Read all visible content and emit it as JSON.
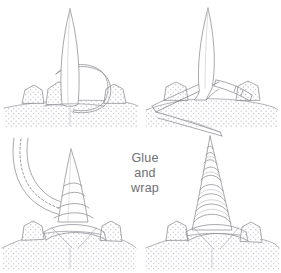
{
  "figure": {
    "title": "Glue and wrap",
    "background_color": "#ffffff",
    "line_color": "#8c8c92",
    "dark_line_color": "#6f6f77",
    "stipple_color": "#b9b9c0",
    "text_color": "#6e6e73",
    "width": 281,
    "height": 273
  },
  "annotation": {
    "line1": "Glue",
    "line2": "and",
    "line3": "wrap"
  },
  "panels": [
    {
      "id": "panel-1",
      "position": "top-left",
      "name": "horn-with-strip-loop",
      "description": "Slender horn standing on stippled ground between two rocks, with a loop of strip material encircling its base",
      "elements": [
        "horn-blade",
        "strip-loop",
        "rock-left",
        "rock-right",
        "ground-stipple",
        "center-seam"
      ]
    },
    {
      "id": "panel-2",
      "position": "top-right",
      "name": "horn-with-diagonal-strip",
      "description": "Horn with a long diagonal strip passing across and behind its base, trailing down to the lower right",
      "elements": [
        "horn-blade",
        "diagonal-strip",
        "strip-tail",
        "rock-left",
        "rock-right",
        "ground-stipple"
      ]
    },
    {
      "id": "panel-3",
      "position": "bottom-left",
      "name": "horn-begin-wrapping",
      "description": "Curved strip with dashed glue line sweeping in from upper left, first wraps applied around the cone base",
      "elements": [
        "curved-strip",
        "glue-dashed-line",
        "cone",
        "wrap-band-1",
        "wrap-band-2",
        "wrap-band-3",
        "rock-left",
        "rock-right",
        "ground-stipple"
      ]
    },
    {
      "id": "panel-4",
      "position": "bottom-right",
      "name": "horn-fully-wrapped",
      "description": "Finished tall spiral-wrapped horn, bands running from base to tip",
      "elements": [
        "cone",
        "spiral-wrap-bands",
        "rock-left",
        "rock-right",
        "ground-stipple"
      ]
    }
  ]
}
